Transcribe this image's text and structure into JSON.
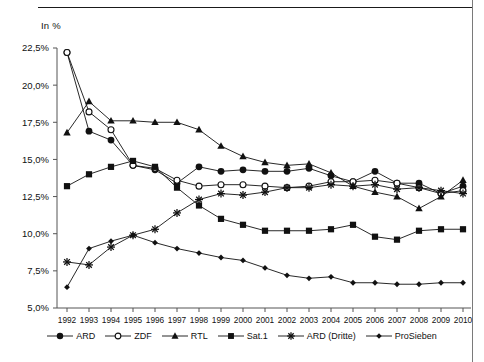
{
  "axis_unit_label": "In %",
  "chart_data": {
    "type": "line",
    "title": "",
    "subtitle": "",
    "xlabel": "",
    "ylabel": "In %",
    "ylim": [
      5.0,
      22.5
    ],
    "ytick_values": [
      5.0,
      7.5,
      10.0,
      12.5,
      15.0,
      17.5,
      20.0,
      22.5
    ],
    "ytick_labels": [
      "5,0%",
      "7,5%",
      "10,0%",
      "12,5%",
      "15,0%",
      "17,5%",
      "20,0%",
      "22,5%"
    ],
    "grid": false,
    "legend_position": "bottom",
    "categories": [
      1992,
      1993,
      1994,
      1995,
      1996,
      1997,
      1998,
      1999,
      2000,
      2001,
      2002,
      2003,
      2004,
      2005,
      2006,
      2007,
      2008,
      2009,
      2010
    ],
    "xtick_labels": [
      "1992",
      "1993",
      "1994",
      "1995",
      "1996",
      "1997",
      "1998",
      "1999",
      "2000",
      "2001",
      "2002",
      "2003",
      "2004",
      "2005",
      "2006",
      "2007",
      "2008",
      "2009",
      "2010"
    ],
    "series": [
      {
        "name": "ARD",
        "marker": "filled-circle",
        "color": "#111111",
        "values": [
          22.2,
          16.9,
          16.3,
          14.6,
          14.3,
          13.4,
          14.5,
          14.2,
          14.3,
          14.2,
          14.2,
          14.4,
          13.9,
          13.5,
          14.2,
          13.4,
          13.4,
          12.7,
          13.2
        ]
      },
      {
        "name": "ZDF",
        "marker": "open-circle",
        "color": "#111111",
        "values": [
          22.2,
          18.2,
          17.0,
          14.6,
          14.4,
          13.6,
          13.2,
          13.3,
          13.3,
          13.2,
          13.1,
          13.2,
          13.5,
          13.5,
          13.6,
          13.4,
          13.1,
          12.7,
          12.9
        ]
      },
      {
        "name": "RTL",
        "marker": "filled-triangle",
        "color": "#111111",
        "values": [
          16.8,
          18.9,
          17.6,
          17.6,
          17.5,
          17.5,
          17.0,
          15.9,
          15.2,
          14.8,
          14.6,
          14.7,
          14.1,
          13.2,
          12.8,
          12.5,
          11.7,
          12.5,
          13.6
        ]
      },
      {
        "name": "Sat.1",
        "marker": "filled-square",
        "color": "#111111",
        "values": [
          13.2,
          14.0,
          14.5,
          14.9,
          14.5,
          13.1,
          11.9,
          11.0,
          10.6,
          10.2,
          10.2,
          10.2,
          10.3,
          10.6,
          9.8,
          9.6,
          10.2,
          10.3,
          10.3
        ]
      },
      {
        "name": "ARD (Dritte)",
        "marker": "star-x",
        "color": "#111111",
        "values": [
          8.1,
          7.9,
          9.1,
          9.9,
          10.3,
          11.4,
          12.3,
          12.7,
          12.6,
          12.8,
          13.1,
          13.1,
          13.3,
          13.2,
          13.3,
          13.0,
          13.1,
          12.9,
          12.7
        ]
      },
      {
        "name": "ProSieben",
        "marker": "small-diamond",
        "color": "#111111",
        "values": [
          6.4,
          9.0,
          9.5,
          9.9,
          9.4,
          9.0,
          8.7,
          8.4,
          8.2,
          7.7,
          7.2,
          7.0,
          7.1,
          6.7,
          6.7,
          6.6,
          6.6,
          6.7,
          6.7
        ]
      }
    ]
  },
  "legend": {
    "items": [
      {
        "label": "ARD",
        "marker": "filled-circle"
      },
      {
        "label": "ZDF",
        "marker": "open-circle"
      },
      {
        "label": "RTL",
        "marker": "filled-triangle"
      },
      {
        "label": "Sat.1",
        "marker": "filled-square"
      },
      {
        "label": "ARD (Dritte)",
        "marker": "star-x"
      },
      {
        "label": "ProSieben",
        "marker": "small-diamond"
      }
    ]
  }
}
